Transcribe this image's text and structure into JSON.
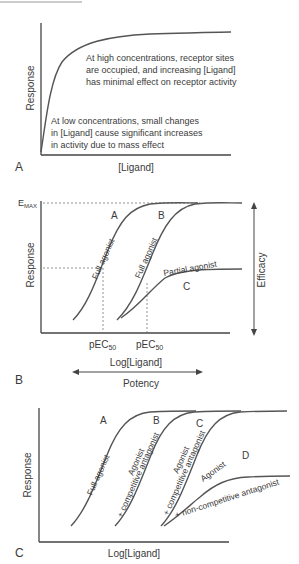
{
  "panel_a": {
    "label": "A",
    "ylabel": "Response",
    "xlabel": "[Ligand]",
    "annotation_high": [
      "At high concentrations, receptor sites",
      "are occupied, and increasing [Ligand]",
      "has minimal effect on receptor activity"
    ],
    "annotation_low": [
      "At low concentrations, small changes",
      "in [Ligand] cause significant increases",
      "in activity due to mass effect"
    ]
  },
  "panel_b": {
    "label": "B",
    "ylabel": "Response",
    "xlabel": "Log[Ligand]",
    "emax_main": "E",
    "emax_sub": "MAX",
    "curve_a_label": "A",
    "curve_b_label": "B",
    "curve_c_label": "C",
    "curve_a_text": "Full agonist",
    "curve_b_text": "Full agonist",
    "curve_c_text": "Partial agonist",
    "pec50_main": "pEC",
    "pec50_sub": "50",
    "efficacy": "Efficacy",
    "potency": "Potency"
  },
  "panel_c": {
    "label": "C",
    "ylabel": "Response",
    "xlabel": "Log[Ligand]",
    "curve_a_label": "A",
    "curve_b_label": "B",
    "curve_c_label": "C",
    "curve_d_label": "D",
    "curve_a_text": "Full agonist",
    "curve_b_text1": "Agonist",
    "curve_b_text2": "+ competitive antagonist",
    "curve_c_text1": "Agonist",
    "curve_c_text2": "+ competitive antagonist",
    "curve_d_text1": "Agonist",
    "curve_d_text2": "+ non-competitive antagonist"
  }
}
